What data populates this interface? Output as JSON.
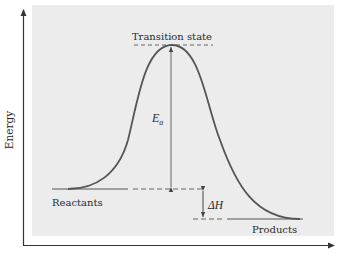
{
  "diagram": {
    "type": "reaction-energy-profile",
    "background_panel_color": "#ececec",
    "curve_color": "#555555",
    "axis_color": "#333333",
    "y_axis_label": "Energy",
    "x_axis_label": "",
    "labels": {
      "transition_state": "Transition state",
      "activation_energy": "E",
      "activation_energy_subscript": "a",
      "enthalpy_change": "ΔH",
      "reactants": "Reactants",
      "products": "Products"
    },
    "levels": {
      "reactants_energy": "higher than products",
      "products_energy": "lower than reactants",
      "transition_state_energy": "maximum"
    },
    "reaction": "exothermic"
  }
}
